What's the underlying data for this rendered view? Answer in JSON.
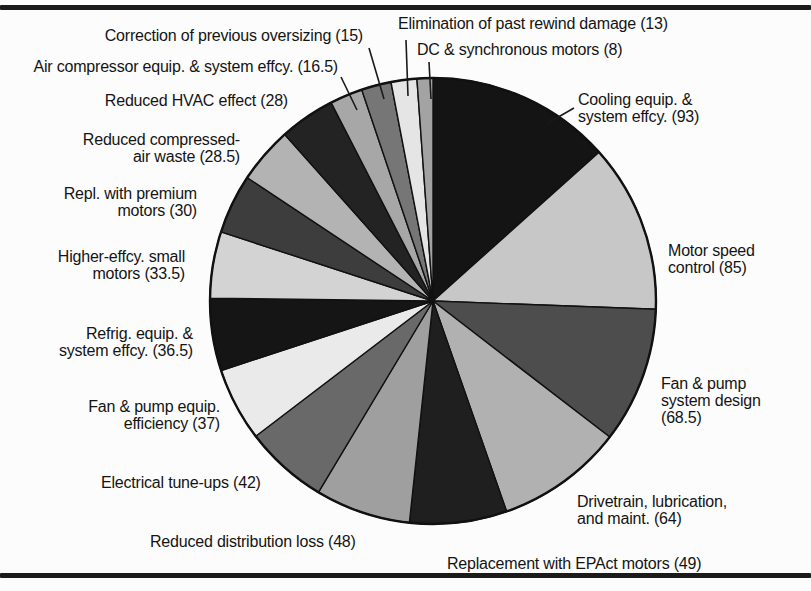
{
  "figure": {
    "background": "#fcfcfc",
    "rule_color": "#1b1b1b",
    "text_color": "#141414"
  },
  "chart_data": {
    "type": "pie",
    "title": "",
    "total": 695.5,
    "start_angle_deg": 0,
    "direction": "clockwise",
    "legend_position": "none",
    "layout": {
      "cx": 433,
      "cy": 301,
      "r": 223,
      "outline_color": "#111111"
    },
    "slices": [
      {
        "label": "Cooling equip. & system effcy.",
        "value": 93,
        "color": "#141414"
      },
      {
        "label": "Motor speed control",
        "value": 85,
        "color": "#c7c7c7"
      },
      {
        "label": "Fan & pump system design",
        "value": 68.5,
        "color": "#4d4d4d"
      },
      {
        "label": "Drivetrain, lubrication, and maint.",
        "value": 64,
        "color": "#b1b1b1"
      },
      {
        "label": "Replacement with EPAct motors",
        "value": 49,
        "color": "#1f1f1f"
      },
      {
        "label": "Reduced distribution loss",
        "value": 48,
        "color": "#9f9f9f"
      },
      {
        "label": "Electrical tune-ups",
        "value": 42,
        "color": "#696969"
      },
      {
        "label": "Fan & pump equip. efficiency",
        "value": 37,
        "color": "#eaeaea"
      },
      {
        "label": "Refrig. equip. & system effcy.",
        "value": 36.5,
        "color": "#151515"
      },
      {
        "label": "Higher-effcy. small motors",
        "value": 33.5,
        "color": "#d3d3d3"
      },
      {
        "label": "Repl. with premium motors",
        "value": 30,
        "color": "#3d3d3d"
      },
      {
        "label": "Reduced compressed-air waste",
        "value": 28.5,
        "color": "#b3b3b3"
      },
      {
        "label": "Reduced HVAC effect",
        "value": 28,
        "color": "#232323"
      },
      {
        "label": "Air compressor equip. & system effcy.",
        "value": 16.5,
        "color": "#a7a7a7"
      },
      {
        "label": "Correction of previous oversizing",
        "value": 15,
        "color": "#767676"
      },
      {
        "label": "Elimination of past rewind damage",
        "value": 13,
        "color": "#e5e5e5"
      },
      {
        "label": "DC & synchronous motors",
        "value": 8,
        "color": "#a3a3a3"
      }
    ],
    "callouts": [
      {
        "slice": "Elimination of past rewind damage",
        "lines": [
          "Elimination of past rewind damage (13)"
        ],
        "align": "left",
        "x": 398,
        "y": 15,
        "leader": [
          406,
          40,
          408,
          96
        ]
      },
      {
        "slice": "DC & synchronous motors",
        "lines": [
          "DC & synchronous motors (8)"
        ],
        "align": "left",
        "x": 417,
        "y": 41,
        "leader": [
          429,
          62,
          431,
          99
        ]
      },
      {
        "slice": "Correction of previous oversizing",
        "lines": [
          "Correction of previous oversizing (15)"
        ],
        "align": "right",
        "x": 363,
        "y": 27,
        "leader": [
          369,
          48,
          384,
          99
        ]
      },
      {
        "slice": "Air compressor equip. & system effcy.",
        "lines": [
          "Air compressor equip. & system effcy. (16.5)"
        ],
        "align": "right",
        "x": 338,
        "y": 58,
        "leader": [
          341,
          77,
          357,
          110
        ]
      },
      {
        "slice": "Cooling equip. & system effcy.",
        "lines": [
          "Cooling equip. &",
          "system effcy. (93)"
        ],
        "align": "left",
        "x": 578,
        "y": 91,
        "leader": [
          574,
          108,
          548,
          123
        ]
      },
      {
        "slice": "Reduced HVAC effect",
        "lines": [
          "Reduced HVAC effect (28)"
        ],
        "align": "right",
        "x": 288,
        "y": 92,
        "leader": null
      },
      {
        "slice": "Reduced compressed-air waste",
        "lines": [
          "Reduced compressed-",
          "air waste (28.5)"
        ],
        "align": "right",
        "x": 240,
        "y": 131,
        "leader": null
      },
      {
        "slice": "Repl. with premium motors",
        "lines": [
          "Repl. with premium",
          "motors (30)"
        ],
        "align": "right",
        "x": 197,
        "y": 185,
        "leader": null
      },
      {
        "slice": "Motor speed control",
        "lines": [
          "Motor speed",
          "control (85)"
        ],
        "align": "left",
        "x": 668,
        "y": 242,
        "leader": null
      },
      {
        "slice": "Higher-effcy. small motors",
        "lines": [
          "Higher-effcy. small",
          "motors (33.5)"
        ],
        "align": "right",
        "x": 185,
        "y": 248,
        "leader": null
      },
      {
        "slice": "Refrig. equip. & system effcy.",
        "lines": [
          "Refrig. equip. &",
          "system effcy. (36.5)"
        ],
        "align": "right",
        "x": 193,
        "y": 325,
        "leader": null
      },
      {
        "slice": "Fan & pump system design",
        "lines": [
          "Fan & pump",
          "system design",
          "(68.5)"
        ],
        "align": "left",
        "x": 661,
        "y": 375,
        "leader": null
      },
      {
        "slice": "Fan & pump equip. efficiency",
        "lines": [
          "Fan & pump equip.",
          "efficiency (37)"
        ],
        "align": "right",
        "x": 220,
        "y": 398,
        "leader": null
      },
      {
        "slice": "Electrical tune-ups",
        "lines": [
          "Electrical tune-ups (42)"
        ],
        "align": "left",
        "x": 101,
        "y": 474,
        "leader": null
      },
      {
        "slice": "Drivetrain, lubrication, and maint.",
        "lines": [
          "Drivetrain, lubrication,",
          "and maint. (64)"
        ],
        "align": "left",
        "x": 577,
        "y": 493,
        "leader": null
      },
      {
        "slice": "Reduced distribution loss",
        "lines": [
          "Reduced distribution loss (48)"
        ],
        "align": "left",
        "x": 150,
        "y": 533,
        "leader": null
      },
      {
        "slice": "Replacement with EPAct motors",
        "lines": [
          "Replacement with EPAct motors (49)"
        ],
        "align": "left",
        "x": 447,
        "y": 555,
        "leader": null
      }
    ]
  }
}
